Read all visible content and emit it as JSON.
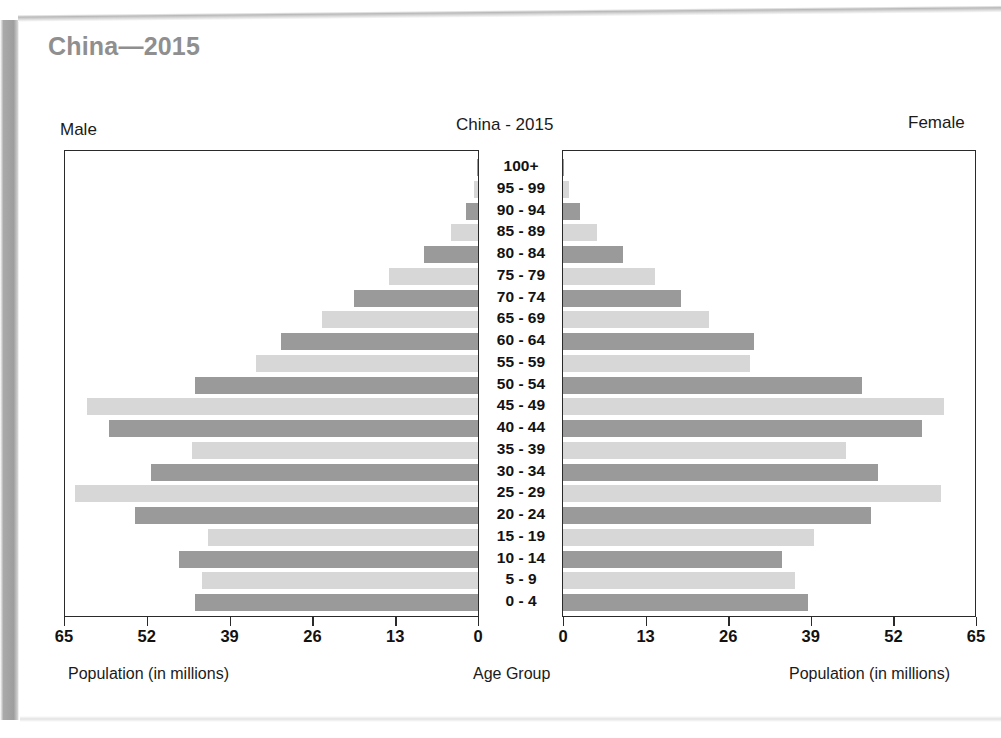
{
  "page": {
    "heading": "China—2015"
  },
  "figure": {
    "chart_title": "China - 2015",
    "male_label": "Male",
    "female_label": "Female",
    "male_axis_caption": "Population (in millions)",
    "female_axis_caption": "Population (in millions)",
    "center_axis_caption": "Age Group",
    "colors": {
      "bar_dark": "#9a9a9a",
      "bar_light": "#d7d7d7",
      "frame": "#2a2a2a",
      "heading": "#8f8f8f",
      "text": "#121212"
    }
  },
  "chart_data": {
    "type": "bar",
    "title": "China - 2015",
    "subtitle": "China—2015",
    "orientation": "horizontal",
    "layout": "population-pyramid",
    "xlabel": "Population (in millions)",
    "ylabel": "Age Group",
    "grid": false,
    "legend": "none",
    "xlim_male": [
      65,
      0
    ],
    "xlim_female": [
      0,
      65
    ],
    "xticks_male": [
      65,
      52,
      39,
      26,
      13,
      0
    ],
    "xticks_female": [
      0,
      13,
      26,
      39,
      52,
      65
    ],
    "categories": [
      "100+",
      "95 - 99",
      "90 - 94",
      "85 - 89",
      "80 - 84",
      "75 - 79",
      "70 - 74",
      "65 - 69",
      "60 - 64",
      "55 - 59",
      "50 - 54",
      "45 - 49",
      "40 - 44",
      "35 - 39",
      "30 - 34",
      "25 - 29",
      "20 - 24",
      "15 - 19",
      "10 - 14",
      "5 - 9",
      "0 - 4"
    ],
    "series": [
      {
        "name": "Male",
        "side": "left",
        "values": [
          0.1,
          0.6,
          1.9,
          4.3,
          8.5,
          14.0,
          19.5,
          24.5,
          31.0,
          35.0,
          44.5,
          61.5,
          58.0,
          45.0,
          51.5,
          63.5,
          54.0,
          42.5,
          47.0,
          43.5,
          44.5
        ]
      },
      {
        "name": "Female",
        "side": "right",
        "values": [
          0.2,
          0.9,
          2.6,
          5.3,
          9.5,
          14.5,
          18.5,
          23.0,
          30.0,
          29.5,
          47.0,
          60.0,
          56.5,
          44.5,
          49.5,
          59.5,
          48.5,
          39.5,
          34.5,
          36.5,
          38.5
        ]
      }
    ],
    "bar_shading": "alternating light/dark gray by age band"
  }
}
